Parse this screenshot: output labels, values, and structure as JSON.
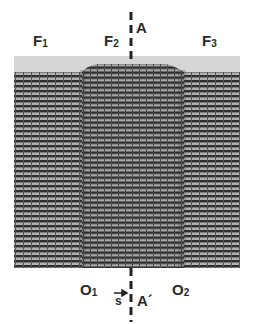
{
  "figure": {
    "labels": {
      "f1": {
        "main": "F",
        "sub": "1"
      },
      "f2": {
        "main": "F",
        "sub": "2"
      },
      "f3": {
        "main": "F",
        "sub": "3"
      },
      "o1": {
        "main": "O",
        "sub": "1"
      },
      "o2": {
        "main": "O",
        "sub": "2"
      },
      "a_top": "A",
      "a_bottom": "A´",
      "s_vector": "s"
    },
    "colors": {
      "fringe_dark": "#2e2e2e",
      "fringe_light": "#a8a8a8",
      "surface_band": "#d4d4d4",
      "text": "#2a2a2a"
    }
  }
}
